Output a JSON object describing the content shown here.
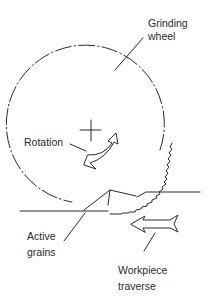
{
  "diagram": {
    "labels": {
      "grinding_wheel_line1": "Grinding",
      "grinding_wheel_line2": "wheel",
      "rotation": "Rotation",
      "active_grains_line1": "Active",
      "active_grains_line2": "grains",
      "workpiece_line1": "Workpiece",
      "workpiece_line2": "traverse"
    },
    "colors": {
      "stroke": "#2a2a2a",
      "background": "#ffffff"
    }
  }
}
